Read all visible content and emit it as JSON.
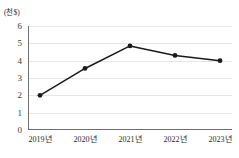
{
  "chart_data": {
    "type": "line",
    "title": "",
    "subtitle": "",
    "xlabel": "",
    "ylabel": "(천$)",
    "unit_label": "(천$)",
    "categories": [
      "2019년",
      "2020년",
      "2021년",
      "2022년",
      "2023년"
    ],
    "values": [
      2.0,
      3.55,
      4.85,
      4.3,
      4.0
    ],
    "series": [
      {
        "name": "",
        "values": [
          2.0,
          3.55,
          4.85,
          4.3,
          4.0
        ]
      }
    ],
    "ylim": [
      0,
      6
    ],
    "yticks": [
      0,
      1,
      2,
      3,
      4,
      5,
      6
    ],
    "ytick_labels": [
      "0",
      "1",
      "2",
      "3",
      "4",
      "5",
      "6"
    ],
    "grid": true,
    "grid_axis": "y",
    "legend": false,
    "legend_position": "none",
    "marker": "circle",
    "line_color": "#1a1a1a",
    "marker_color": "#1a1a1a",
    "grid_color": "#e6e6e6",
    "axis_color": "#6f6f6f"
  }
}
